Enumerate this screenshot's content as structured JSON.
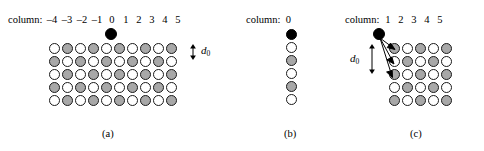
{
  "figure": {
    "caption_style": "lattice-diagram",
    "colors": {
      "white_site": "#ffffff",
      "gray_site": "#a8a8a8",
      "black_site": "#000000",
      "outline": "#1a1a1a",
      "background": "#ffffff"
    }
  },
  "panels": [
    {
      "id": "a",
      "label": "(a)",
      "header_label": "column:",
      "columns": [
        "–4",
        "–3",
        "–2",
        "–1",
        "0",
        "1",
        "2",
        "3",
        "4",
        "5"
      ],
      "spacing_label": "d",
      "spacing_subscript": "0",
      "adatom_column": "0",
      "lattice": [
        [
          "white",
          "gray",
          "white",
          "gray",
          "white",
          "gray",
          "white",
          "gray",
          "white",
          "gray"
        ],
        [
          "gray",
          "white",
          "gray",
          "white",
          "gray",
          "white",
          "gray",
          "white",
          "gray",
          "white"
        ],
        [
          "white",
          "gray",
          "white",
          "gray",
          "white",
          "gray",
          "white",
          "gray",
          "white",
          "gray"
        ],
        [
          "gray",
          "white",
          "gray",
          "white",
          "gray",
          "white",
          "gray",
          "white",
          "gray",
          "white"
        ],
        [
          "white",
          "gray",
          "white",
          "gray",
          "white",
          "gray",
          "white",
          "gray",
          "white",
          "gray"
        ]
      ]
    },
    {
      "id": "b",
      "label": "(b)",
      "header_label": "column:",
      "columns": [
        "0"
      ],
      "lattice": [
        [
          "black"
        ],
        [
          "white"
        ],
        [
          "gray"
        ],
        [
          "white"
        ],
        [
          "gray"
        ],
        [
          "white"
        ]
      ]
    },
    {
      "id": "c",
      "label": "(c)",
      "header_label": "column:",
      "columns": [
        "1",
        "2",
        "3",
        "4",
        "5"
      ],
      "spacing_label": "d",
      "spacing_subscript": "0",
      "arrow_count": 3,
      "lattice": [
        [
          "gray",
          "white",
          "gray",
          "white",
          "gray"
        ],
        [
          "white",
          "gray",
          "white",
          "gray",
          "white"
        ],
        [
          "gray",
          "white",
          "gray",
          "white",
          "gray"
        ],
        [
          "white",
          "gray",
          "white",
          "gray",
          "white"
        ],
        [
          "gray",
          "white",
          "gray",
          "white",
          "gray"
        ]
      ]
    }
  ]
}
